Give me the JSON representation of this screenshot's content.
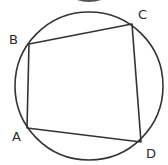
{
  "diagram": {
    "type": "cyclic-quadrilateral",
    "colors": {
      "stroke": "#333333",
      "background": "#ffffff",
      "label": "#2a2a2a"
    },
    "circle": {
      "cx": 89,
      "cy": 86,
      "r": 74
    },
    "top_artifact": {
      "cx": 89,
      "cy": -4,
      "rx": 16,
      "ry": 6
    },
    "vertices": [
      {
        "name": "A",
        "x": 27,
        "y": 128,
        "label_x": 12,
        "label_y": 141
      },
      {
        "name": "B",
        "x": 29,
        "y": 44,
        "label_x": 9,
        "label_y": 44
      },
      {
        "name": "C",
        "x": 132,
        "y": 24,
        "label_x": 138,
        "label_y": 19
      },
      {
        "name": "D",
        "x": 141,
        "y": 142,
        "label_x": 146,
        "label_y": 158
      }
    ],
    "edges": [
      [
        "A",
        "B"
      ],
      [
        "B",
        "C"
      ],
      [
        "C",
        "D"
      ],
      [
        "D",
        "A"
      ]
    ],
    "labels": {
      "A": "A",
      "B": "B",
      "C": "C",
      "D": "D"
    }
  }
}
